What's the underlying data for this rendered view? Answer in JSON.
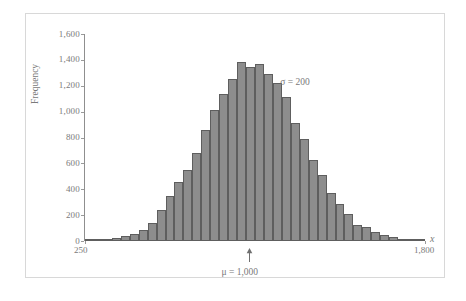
{
  "figure": {
    "type": "histogram-figure",
    "background": "#ffffff",
    "frame_color": "#d8d8d8",
    "bar_fill": "#8d8d8d",
    "bar_stroke": "#5e5e5e",
    "axis_color": "#8f8f8f",
    "text_color": "#7a7a7a"
  },
  "chart_data": {
    "type": "bar",
    "title": "",
    "subtitle": "",
    "xlabel": "x",
    "ylabel": "Frequency",
    "xlim": [
      250,
      1800
    ],
    "ylim": [
      0,
      1600
    ],
    "grid": false,
    "legend": "none",
    "x_tick_labels": [
      "250",
      "1,800"
    ],
    "x_tick_values": [
      250,
      1800
    ],
    "y_tick_labels": [
      "0",
      "200",
      "400",
      "600",
      "800",
      "1,000",
      "1,200",
      "1,400",
      "1,600"
    ],
    "y_tick_values": [
      0,
      200,
      400,
      600,
      800,
      1000,
      1200,
      1400,
      1600
    ],
    "bin_width": 41,
    "bin_starts": [
      250,
      291,
      332,
      373,
      414,
      455,
      496,
      537,
      578,
      619,
      660,
      701,
      742,
      783,
      824,
      865,
      906,
      947,
      988,
      1029,
      1070,
      1111,
      1152,
      1193,
      1234,
      1275,
      1316,
      1357,
      1398,
      1439,
      1480,
      1521,
      1562,
      1603,
      1644,
      1685,
      1726,
      1767
    ],
    "categories": [
      "250",
      "291",
      "332",
      "373",
      "414",
      "455",
      "496",
      "537",
      "578",
      "619",
      "660",
      "701",
      "742",
      "783",
      "824",
      "865",
      "906",
      "947",
      "988",
      "1029",
      "1070",
      "1111",
      "1152",
      "1193",
      "1234",
      "1275",
      "1316",
      "1357",
      "1398",
      "1439",
      "1480",
      "1521",
      "1562",
      "1603",
      "1644",
      "1685",
      "1726",
      "1767"
    ],
    "values": [
      5,
      8,
      12,
      20,
      35,
      55,
      85,
      140,
      240,
      350,
      455,
      550,
      680,
      860,
      1010,
      1140,
      1250,
      1385,
      1345,
      1370,
      1290,
      1225,
      1110,
      910,
      790,
      625,
      510,
      370,
      285,
      205,
      125,
      105,
      70,
      45,
      28,
      18,
      12,
      8
    ],
    "annotations": [
      {
        "name": "sigma",
        "text": "σ = 200",
        "x": 1240,
        "y": 1230
      },
      {
        "name": "mu",
        "text": "μ = 1,000",
        "x": 1000,
        "y": -180,
        "arrow": "up"
      }
    ]
  },
  "labels": {
    "y_axis_title": "Frequency",
    "x_axis_title": "x",
    "sigma_text": "σ = 200",
    "mu_text": "μ = 1,000"
  }
}
